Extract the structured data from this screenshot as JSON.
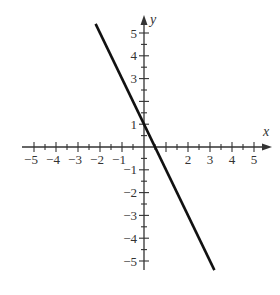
{
  "chart_data": {
    "type": "line",
    "title": "",
    "xlabel": "x",
    "ylabel": "y",
    "xlim": [
      -5,
      5
    ],
    "ylim": [
      -5,
      5
    ],
    "grid": false,
    "x_ticks": [
      -5,
      -4,
      -3,
      -2,
      -1,
      1,
      2,
      3,
      4,
      5
    ],
    "x_tick_labels": [
      "−5",
      "−4",
      "−3",
      "−2",
      "−1",
      "",
      "2",
      "3",
      "4",
      "5"
    ],
    "y_ticks": [
      -5,
      -4,
      -3,
      -2,
      -1,
      1,
      2,
      3,
      4,
      5
    ],
    "y_tick_labels": [
      "−5",
      "−4",
      "−3",
      "−2",
      "−1",
      "1",
      "",
      "3",
      "4",
      "5"
    ],
    "minor_tick_step": 0.5,
    "series": [
      {
        "name": "y = -2x + 1",
        "slope": -2,
        "intercept": 1,
        "x": [
          -2.2,
          3.2
        ],
        "y": [
          5.4,
          -5.4
        ],
        "color": "#111111"
      }
    ]
  },
  "axes": {
    "x_label": "x",
    "y_label": "y",
    "color": "#333333"
  }
}
